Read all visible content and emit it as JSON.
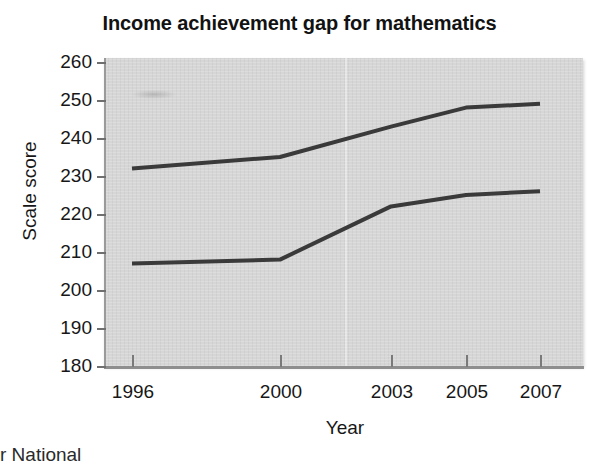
{
  "chart_data": {
    "type": "line",
    "title": "Income achievement gap for mathematics",
    "xlabel": "Year",
    "ylabel": "Scale score",
    "x": [
      1996,
      2000,
      2003,
      2005,
      2007
    ],
    "xtick_labels": [
      "1996",
      "2000",
      "2003",
      "2005",
      "2007"
    ],
    "ytick_labels": [
      "260",
      "250",
      "240",
      "230",
      "220",
      "210",
      "200",
      "190",
      "180"
    ],
    "ytick_values": [
      260,
      250,
      240,
      230,
      220,
      210,
      200,
      190,
      180
    ],
    "ylim": [
      180,
      260
    ],
    "xlim": [
      1994.8,
      2008.2
    ],
    "grid": false,
    "legend": "none",
    "series": [
      {
        "name": "Higher income",
        "color": "#3a3a3a",
        "values": [
          232,
          235,
          243,
          248,
          249
        ]
      },
      {
        "name": "Lower income",
        "color": "#3a3a3a",
        "values": [
          207,
          208,
          222,
          225,
          226
        ]
      }
    ],
    "plot_background": "#d6d6d6",
    "line_color": "#3a3a3a"
  },
  "figure": {
    "title": "Income achievement gap for mathematics",
    "axis_x_label": "Year",
    "axis_y_label": "Scale score",
    "source_note": "r National"
  }
}
